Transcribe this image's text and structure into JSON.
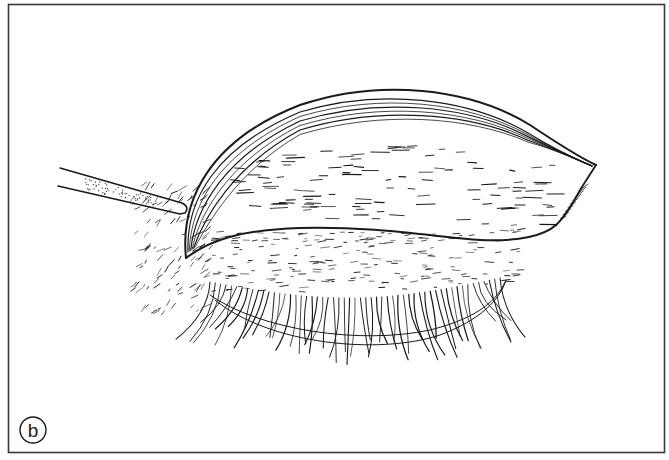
{
  "figure": {
    "panel_label": "b",
    "colors": {
      "ink": "#1a1a1a",
      "frame": "#3a3a3a",
      "background": "#ffffff"
    }
  }
}
